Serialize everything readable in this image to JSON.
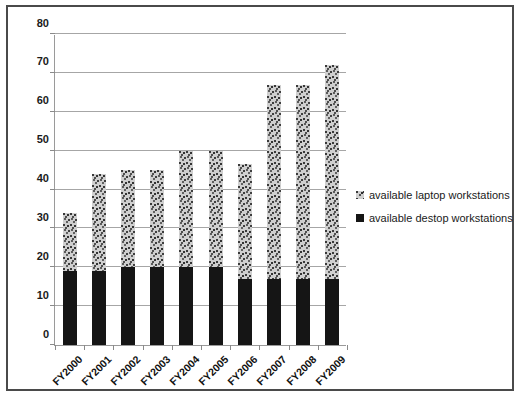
{
  "chart_data": {
    "type": "bar",
    "stacked": true,
    "title": "",
    "xlabel": "",
    "ylabel": "",
    "ylim": [
      0,
      80
    ],
    "yticks": [
      0,
      10,
      20,
      30,
      40,
      50,
      60,
      70,
      80
    ],
    "grid": true,
    "legend_position": "right",
    "categories": [
      "FY2000",
      "FY2001",
      "FY2002",
      "FY2003",
      "FY2004",
      "FY2005",
      "FY2006",
      "FY2007",
      "FY2008",
      "FY2009"
    ],
    "series": [
      {
        "name": "available destop workstations",
        "key": "desktop",
        "color": "#151515",
        "values": [
          19,
          19,
          20,
          20,
          20,
          20,
          17,
          17,
          17,
          17
        ]
      },
      {
        "name": "available laptop workstations",
        "key": "laptop",
        "color": "#cfcfcf",
        "values": [
          15,
          25,
          25,
          25,
          30,
          30,
          29.5,
          50,
          50,
          55
        ]
      }
    ],
    "totals": [
      34,
      44,
      45,
      45,
      50,
      50,
      46.5,
      67,
      67,
      72
    ]
  },
  "legend": {
    "entries": [
      {
        "label": "available laptop workstations",
        "swatch": "gray-pattern-swatch"
      },
      {
        "label": "available destop workstations",
        "swatch": "black-swatch"
      }
    ]
  },
  "axes": {
    "y_tick_labels": [
      "0",
      "10",
      "20",
      "30",
      "40",
      "50",
      "60",
      "70",
      "80"
    ],
    "x_tick_labels": [
      "FY2000",
      "FY2001",
      "FY2002",
      "FY2003",
      "FY2004",
      "FY2005",
      "FY2006",
      "FY2007",
      "FY2008",
      "FY2009"
    ]
  }
}
